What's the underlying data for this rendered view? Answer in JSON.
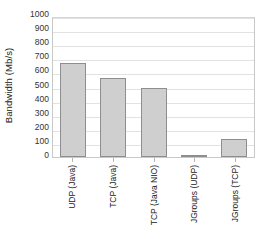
{
  "chart_data": {
    "type": "bar",
    "title": "",
    "xlabel": "",
    "ylabel": "Bandwidth (Mb/s)",
    "categories": [
      "UDP (Java)",
      "TCP (Java)",
      "TCP (Java NIO)",
      "JGroups (UDP)",
      "JGroups (TCP)"
    ],
    "values": [
      670,
      560,
      490,
      15,
      130
    ],
    "ylim": [
      0,
      1000
    ],
    "ytick_labels": [
      "1000",
      "900",
      "800",
      "700",
      "600",
      "500",
      "400",
      "300",
      "200",
      "100",
      "0"
    ],
    "ytick_values": [
      1000,
      900,
      800,
      700,
      600,
      500,
      400,
      300,
      200,
      100,
      0
    ],
    "ytick_step": 100,
    "grid": "horizontal",
    "legend": "none",
    "bar_fill": "#cfcfcf",
    "bar_edge": "#8e8e8e",
    "grid_color": "#e2e2e2",
    "axis_color": "#c8c8c8",
    "background": "#ffffff",
    "xlabel_rotation": 90
  }
}
